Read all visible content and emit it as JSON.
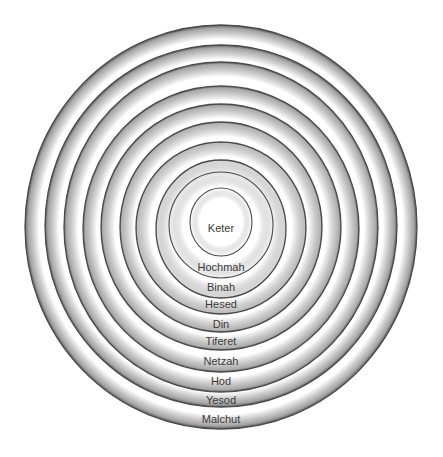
{
  "diagram": {
    "type": "concentric-rings",
    "center_x": 221,
    "colors": {
      "background": "#ffffff",
      "ring_stroke": "#4a4a4a",
      "ring_shade": "#9a9a9a",
      "label_text": "#3a3a3a"
    },
    "rings": [
      {
        "label": "Malchut",
        "cy": 227,
        "rx": 196,
        "ry": 202,
        "label_y": 420,
        "shade": 0.9
      },
      {
        "label": "Yesod",
        "cy": 226,
        "rx": 176,
        "ry": 181,
        "label_y": 401,
        "shade": 0.9
      },
      {
        "label": "Hod",
        "cy": 227,
        "rx": 157,
        "ry": 165,
        "label_y": 382,
        "shade": 0.85
      },
      {
        "label": "Netzah",
        "cy": 229,
        "rx": 138,
        "ry": 143,
        "label_y": 362,
        "shade": 0.85
      },
      {
        "label": "Tiferet",
        "cy": 227,
        "rx": 120,
        "ry": 123,
        "label_y": 342,
        "shade": 0.8
      },
      {
        "label": "Din",
        "cy": 227,
        "rx": 101,
        "ry": 105,
        "label_y": 325,
        "shade": 0.75
      },
      {
        "label": "Hesed",
        "cy": 228,
        "rx": 85,
        "ry": 86,
        "label_y": 305,
        "shade": 0.65
      },
      {
        "label": "Binah",
        "cy": 229,
        "rx": 65,
        "ry": 69,
        "label_y": 288,
        "shade": 0.4
      },
      {
        "label": "Hochmah",
        "cy": 225,
        "rx": 52,
        "ry": 53,
        "label_y": 268,
        "shade": 0.15
      },
      {
        "label": "Keter",
        "cy": 222,
        "rx": 31,
        "ry": 34,
        "label_y": 229,
        "shade": 0.0
      }
    ]
  }
}
